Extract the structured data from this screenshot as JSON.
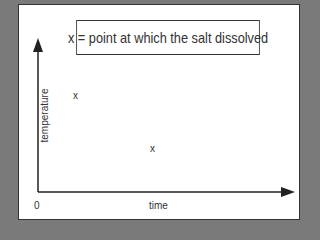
{
  "diagram": {
    "legend": "x = point at which the salt dissolved",
    "y_axis_label": "temperature",
    "x_axis_label": "time",
    "origin_label": "0",
    "marker": "x",
    "points": [
      {
        "label": "x",
        "x": 76,
        "y": 97
      },
      {
        "label": "x",
        "x": 153,
        "y": 149
      }
    ]
  }
}
